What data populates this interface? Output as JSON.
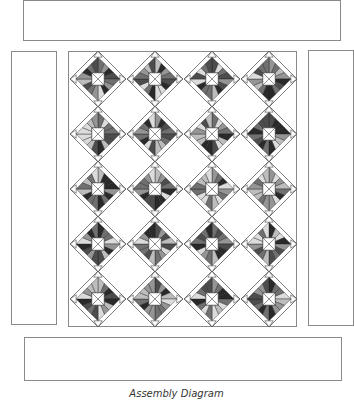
{
  "caption": "Assembly Diagram",
  "colors": {
    "outline": "#8a8a8a",
    "block_outline": "#222222",
    "fills": [
      "#2a2a2a",
      "#4d4d4d",
      "#707070",
      "#959595",
      "#bdbdbd",
      "#dcdcdc"
    ]
  },
  "panels": {
    "top_border": {
      "x": 23,
      "y": 0,
      "w": 318,
      "h": 41
    },
    "left_border": {
      "x": 11,
      "y": 51,
      "w": 46,
      "h": 274
    },
    "center_field": {
      "x": 68,
      "y": 51,
      "w": 229,
      "h": 276
    },
    "right_border": {
      "x": 308,
      "y": 50,
      "w": 46,
      "h": 276
    },
    "bottom_border": {
      "x": 24,
      "y": 337,
      "w": 318,
      "h": 44
    }
  },
  "blocks": {
    "columns": 4,
    "rows": 5,
    "col_centers": [
      98,
      155,
      212,
      269
    ],
    "row_centers": [
      79,
      134,
      189,
      244,
      299
    ],
    "half_size": 28
  }
}
